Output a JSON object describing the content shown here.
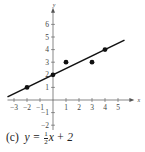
{
  "chart_data": {
    "type": "scatter",
    "title": "",
    "caption_label": "(c)",
    "equation": "y = 1/2 x + 2",
    "xlabel": "x",
    "ylabel": "y",
    "xlim": [
      -3.5,
      5.8
    ],
    "ylim": [
      -2.5,
      7
    ],
    "x_ticks": [
      -3,
      -2,
      -1,
      1,
      2,
      3,
      4,
      5
    ],
    "y_ticks": [
      -2,
      -1,
      1,
      2,
      3,
      4,
      5,
      6
    ],
    "grid": false,
    "points": [
      {
        "x": -2,
        "y": 1
      },
      {
        "x": 0,
        "y": 2
      },
      {
        "x": 1,
        "y": 3
      },
      {
        "x": 3,
        "y": 3
      },
      {
        "x": 4,
        "y": 4
      }
    ],
    "line": {
      "slope": 0.5,
      "intercept": 2,
      "x_start": -3.5,
      "x_end": 5.5
    }
  },
  "caption": {
    "label": "(c)",
    "lhs": "y =",
    "frac_num": "1",
    "frac_den": "2",
    "rhs": "x + 2"
  }
}
